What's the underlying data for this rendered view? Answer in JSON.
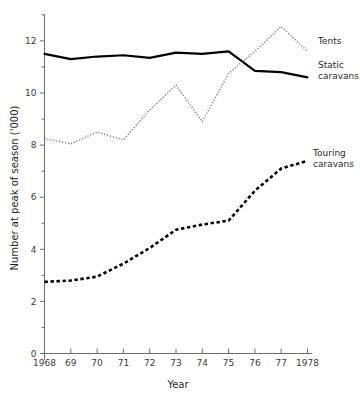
{
  "chart_data": {
    "type": "line",
    "title": "",
    "xlabel": "Year",
    "ylabel": "Number at peak of season ('000)",
    "x": [
      1968,
      1969,
      1970,
      1971,
      1972,
      1973,
      1974,
      1975,
      1976,
      1977,
      1978
    ],
    "x_tick_labels": [
      "1968",
      "69",
      "70",
      "71",
      "72",
      "73",
      "74",
      "75",
      "76",
      "77",
      "1978"
    ],
    "y_tick_labels": [
      "0",
      "2",
      "4",
      "6",
      "8",
      "10",
      "12"
    ],
    "y_tick_values": [
      0,
      2,
      4,
      6,
      8,
      10,
      12
    ],
    "y_minor_tick_values": [
      1,
      3,
      5,
      7,
      9,
      11,
      13
    ],
    "ylim": [
      0,
      13.2
    ],
    "xlim": [
      1968,
      1978
    ],
    "grid": false,
    "legend_position": "right-inline-labels",
    "series": [
      {
        "name": "Static caravans",
        "style": "solid",
        "color": "#000000",
        "values": [
          11.5,
          11.3,
          11.4,
          11.45,
          11.35,
          11.55,
          11.5,
          11.6,
          10.85,
          10.8,
          10.6
        ]
      },
      {
        "name": "Tents",
        "style": "dotted",
        "color": "#777777",
        "values": [
          8.25,
          8.05,
          8.5,
          8.2,
          9.35,
          10.3,
          8.9,
          10.75,
          11.6,
          12.55,
          11.6
        ]
      },
      {
        "name": "Touring caravans",
        "style": "dashed",
        "color": "#000000",
        "values": [
          2.75,
          2.8,
          2.95,
          3.45,
          4.05,
          4.75,
          4.95,
          5.1,
          6.25,
          7.1,
          7.4
        ]
      }
    ],
    "annotations": [
      {
        "text": "Tents",
        "series": "Tents",
        "anchor_x": 1978
      },
      {
        "text": "Static",
        "series": "Static caravans",
        "anchor_x": 1978
      },
      {
        "text": "caravans",
        "series": "Static caravans",
        "anchor_x": 1978
      },
      {
        "text": "Touring",
        "series": "Touring caravans",
        "anchor_x": 1978
      },
      {
        "text": "caravans",
        "series": "Touring caravans",
        "anchor_x": 1978
      }
    ]
  },
  "labels": {
    "y_axis_title": "Number at peak of season ('000)",
    "x_axis_title": "Year",
    "tents": "Tents",
    "static_line1": "Static",
    "static_line2": "caravans",
    "touring_line1": "Touring",
    "touring_line2": "caravans"
  }
}
